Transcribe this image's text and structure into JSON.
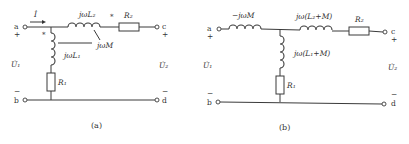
{
  "diagram_a": {
    "caption": "(a)",
    "terminals": {
      "a": "a",
      "b": "b",
      "c": "c",
      "d": "d"
    },
    "signs": {
      "a_plus": "+",
      "b_minus": "−",
      "c_plus": "+",
      "d_minus": "−"
    },
    "current_label": "İ",
    "voltage_in": "U̇₁",
    "voltage_out": "U̇₂",
    "L2_label": "jωL₂",
    "L1_label": "jωL₁",
    "M_label": "jωM",
    "R1_label": "R₁",
    "R2_label": "R₂",
    "dot1": "*",
    "dot2": "*"
  },
  "diagram_b": {
    "caption": "(b)",
    "terminals": {
      "a": "a",
      "b": "b",
      "c": "c",
      "d": "d"
    },
    "signs": {
      "a_plus": "+",
      "b_minus": "−",
      "c_plus": "+",
      "d_minus": "−"
    },
    "voltage_in": "U̇₁",
    "voltage_out": "U̇₂",
    "series_left_label": "−jωM",
    "series_right_label": "jω(L₂+M)",
    "shunt_label": "jω(L₁+M)",
    "R1_label": "R₁",
    "R2_label": "R₂"
  }
}
